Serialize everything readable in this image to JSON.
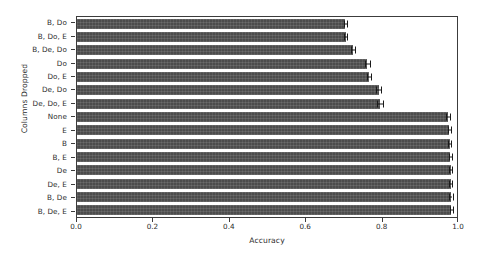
{
  "chart_data": {
    "type": "bar",
    "orientation": "horizontal",
    "title": "",
    "xlabel": "Accuracy",
    "ylabel": "Columns Dropped",
    "xlim": [
      0.0,
      1.0
    ],
    "grid": false,
    "legend": null,
    "bar_color": "#4c4c4c",
    "categories": [
      "B, Do",
      "B, Do, E",
      "B, De, Do",
      "Do",
      "Do, E",
      "De, Do",
      "De, Do, E",
      "None",
      "E",
      "B",
      "B, E",
      "De",
      "De, E",
      "B, De",
      "B, De, E"
    ],
    "values": [
      0.702,
      0.704,
      0.723,
      0.76,
      0.764,
      0.79,
      0.794,
      0.971,
      0.975,
      0.976,
      0.977,
      0.978,
      0.978,
      0.979,
      0.98
    ],
    "errors": [
      0.004,
      0.004,
      0.006,
      0.006,
      0.005,
      0.007,
      0.008,
      0.005,
      0.004,
      0.004,
      0.004,
      0.004,
      0.004,
      0.004,
      0.004
    ],
    "xticks": [
      0.0,
      0.2,
      0.4,
      0.6,
      0.8,
      1.0
    ],
    "xticklabels": [
      "0.0",
      "0.2",
      "0.4",
      "0.6",
      "0.8",
      "1.0"
    ]
  }
}
